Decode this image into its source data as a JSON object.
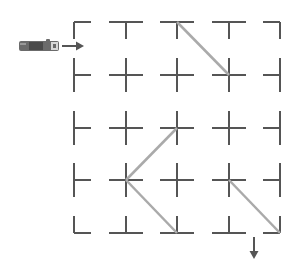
{
  "diagram": {
    "title": "Light path through mirror grid",
    "colors": {
      "grid": "#555555",
      "mirror": "#aaaaaa",
      "arrow": "#555555",
      "flashlight_body": "#6b6b6b",
      "flashlight_band": "#4a4a4a",
      "flashlight_head": "#d8d8d8",
      "background": "#ffffff"
    },
    "grid": {
      "columns_x": [
        74,
        126,
        177,
        229,
        280
      ],
      "rows_y": [
        22,
        75,
        128,
        180,
        233
      ],
      "arm_length": 17
    },
    "mirrors": [
      {
        "from": [
          177,
          22
        ],
        "to": [
          229,
          75
        ]
      },
      {
        "from": [
          177,
          128
        ],
        "to": [
          126,
          180
        ]
      },
      {
        "from": [
          126,
          180
        ],
        "to": [
          177,
          233
        ]
      },
      {
        "from": [
          229,
          180
        ],
        "to": [
          280,
          233
        ]
      }
    ],
    "source": {
      "icon": "flashlight-icon",
      "x": 19,
      "y": 41,
      "width": 40,
      "height": 10,
      "arrow": {
        "from": [
          62,
          46
        ],
        "to": [
          84,
          46
        ],
        "direction": "right"
      }
    },
    "exit": {
      "icon": "arrow-down-icon",
      "arrow": {
        "from": [
          254,
          237
        ],
        "to": [
          254,
          259
        ],
        "direction": "down"
      }
    }
  }
}
